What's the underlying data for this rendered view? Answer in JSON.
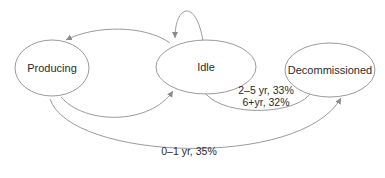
{
  "diagram": {
    "type": "state-transition",
    "nodes": [
      {
        "id": "producing",
        "label": "Producing"
      },
      {
        "id": "idle",
        "label": "Idle"
      },
      {
        "id": "decommissioned",
        "label": "Decommissioned"
      }
    ],
    "edges": [
      {
        "from": "idle",
        "to": "producing",
        "label": ""
      },
      {
        "from": "producing",
        "to": "idle",
        "label": ""
      },
      {
        "from": "idle",
        "to": "idle",
        "label": ""
      },
      {
        "from": "idle",
        "to": "decommissioned",
        "label_line1": "2–5 yr, 33%",
        "label_line2": "6+yr, 32%"
      },
      {
        "from": "producing",
        "to": "decommissioned",
        "label": "0–1 yr, 35%"
      }
    ],
    "colors": {
      "stroke": "#9a9a9a",
      "text": "#2a2a2a",
      "background": "#ffffff"
    }
  }
}
